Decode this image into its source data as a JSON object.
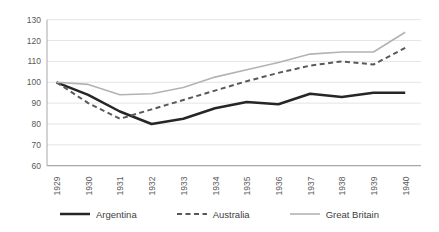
{
  "chart_data": {
    "type": "line",
    "title": "",
    "xlabel": "",
    "ylabel": "",
    "x_categories": [
      "1929",
      "1930",
      "1931",
      "1932",
      "1933",
      "1934",
      "1935",
      "1936",
      "1937",
      "1938",
      "1939",
      "1940"
    ],
    "yticks": [
      "60",
      "70",
      "80",
      "90",
      "100",
      "110",
      "120",
      "130"
    ],
    "ylim": [
      60,
      130
    ],
    "ytick_step": 10,
    "grid": "horizontal",
    "legend_position": "bottom",
    "series": [
      {
        "name": "Argentina",
        "line_style": "solid",
        "color": "#262626",
        "stroke_width": 2.5,
        "values": [
          100,
          94,
          86,
          80,
          82.5,
          87.5,
          90.5,
          89.5,
          94.5,
          93,
          95,
          95
        ]
      },
      {
        "name": "Australia",
        "line_style": "dashed",
        "color": "#595959",
        "stroke_width": 2,
        "values": [
          100,
          90,
          82.5,
          87,
          91.5,
          96,
          100.5,
          104.5,
          108,
          110,
          108.5,
          116.5
        ]
      },
      {
        "name": "Great Britain",
        "line_style": "solid",
        "color": "#b3b3b3",
        "stroke_width": 1.6,
        "values": [
          100,
          99,
          94,
          94.5,
          97.5,
          102.5,
          106,
          109.5,
          113.5,
          114.5,
          114.5,
          124
        ]
      }
    ]
  },
  "style": {
    "background": "#ffffff",
    "grid_color": "#e4e4e4",
    "axis_color": "#a8a8a8",
    "tick_label_color": "#595959"
  }
}
